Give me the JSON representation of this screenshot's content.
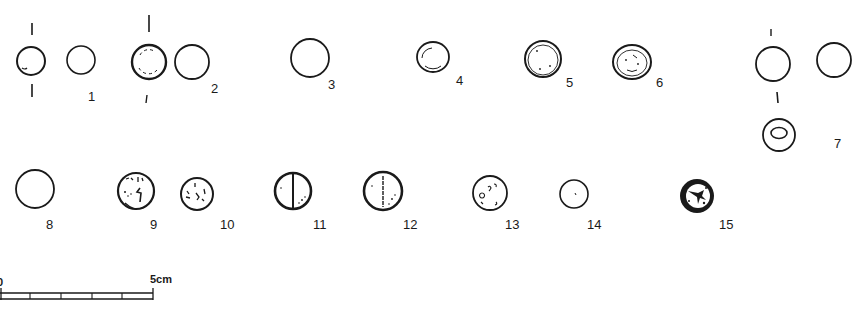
{
  "figure": {
    "type": "archaeological-plate",
    "background": "#ffffff",
    "ink_color": "#1a1a1a",
    "items": [
      {
        "id": 1,
        "label": "1",
        "description": "small bead, side and top views with section marks"
      },
      {
        "id": 2,
        "label": "2",
        "description": "bead with dashed inner outline, plus plain view"
      },
      {
        "id": 3,
        "label": "3",
        "description": "plain circular bead"
      },
      {
        "id": 4,
        "label": "4",
        "description": "irregular double-outlined bead"
      },
      {
        "id": 5,
        "label": "5",
        "description": "double-outlined bead with speckles"
      },
      {
        "id": 6,
        "label": "6",
        "description": "double-outlined bead with internal marks"
      },
      {
        "id": 7,
        "label": "7",
        "description": "bead with side view and perforated section view"
      },
      {
        "id": 8,
        "label": "8",
        "description": "plain circular disc"
      },
      {
        "id": 9,
        "label": "9",
        "description": "coin with inscription marks"
      },
      {
        "id": 10,
        "label": "10",
        "description": "smaller coin with inscription marks"
      },
      {
        "id": 11,
        "label": "11",
        "description": "disc with central vertical line, bold"
      },
      {
        "id": 12,
        "label": "12",
        "description": "disc with central vertical line, stippled"
      },
      {
        "id": 13,
        "label": "13",
        "description": "disc with scattered marks"
      },
      {
        "id": 14,
        "label": "14",
        "description": "small plain disc with central dot"
      },
      {
        "id": 15,
        "label": "15",
        "description": "dark coin with figure motif"
      }
    ]
  },
  "scale_bar": {
    "start_label": "0",
    "end_label": "5cm",
    "divisions": 5
  }
}
